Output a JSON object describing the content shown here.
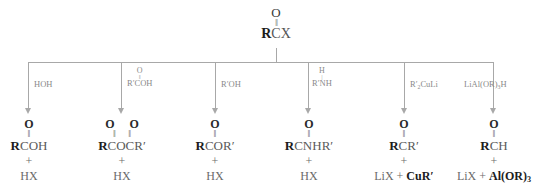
{
  "diagram": {
    "type": "reaction-scheme",
    "line_color": "#a8a8a8",
    "text_color": "#3a3a3a",
    "emphasis_color": "#1c1c1c",
    "background": "#ffffff"
  },
  "starting_material": {
    "carbonyl_oxygen": "O",
    "double_bond": "‖",
    "formula_bold": "R",
    "formula_rest": "CX",
    "name": "acyl-halide"
  },
  "branches": [
    {
      "id": "hydrolysis",
      "reagent": {
        "main": "HOH",
        "top": "",
        "bond": ""
      },
      "product": {
        "oxygens": "O",
        "bonds": "‖",
        "formula_bold": "R",
        "formula_rest": "COH",
        "plus": "+",
        "byproduct_plain": "HX",
        "byproduct_bold": ""
      }
    },
    {
      "id": "anhydride-formation",
      "reagent": {
        "main": "R′COH",
        "top": "O",
        "bond": "‖"
      },
      "product": {
        "oxygens": "O  O",
        "bonds": "‖  ‖",
        "formula_bold": "R",
        "formula_rest": "COCR′",
        "plus": "+",
        "byproduct_plain": "HX",
        "byproduct_bold": ""
      }
    },
    {
      "id": "esterification",
      "reagent": {
        "main": "R′OH",
        "top": "",
        "bond": ""
      },
      "product": {
        "oxygens": "O",
        "bonds": "‖",
        "formula_bold": "R",
        "formula_rest": "COR′",
        "plus": "+",
        "byproduct_plain": "HX",
        "byproduct_bold": ""
      }
    },
    {
      "id": "amide-formation",
      "reagent": {
        "main": "R′NH",
        "top": "H",
        "bond": "|"
      },
      "product": {
        "oxygens": "O",
        "bonds": "‖",
        "formula_bold": "R",
        "formula_rest": "CNHR′",
        "plus": "+",
        "byproduct_plain": "HX",
        "byproduct_bold": ""
      }
    },
    {
      "id": "ketone-formation",
      "reagent": {
        "main": "R′₂CuLi",
        "top": "",
        "bond": ""
      },
      "product": {
        "oxygens": "O",
        "bonds": "‖",
        "formula_bold": "R",
        "formula_rest": "CR′",
        "plus": "+",
        "byproduct_plain": "LiX  +  ",
        "byproduct_bold": "CuR′"
      }
    },
    {
      "id": "aldehyde-formation",
      "reagent": {
        "main": "LiAl(OR)₃H",
        "top": "",
        "bond": ""
      },
      "product": {
        "oxygens": "O",
        "bonds": "‖",
        "formula_bold": "R",
        "formula_rest": "CH",
        "plus": "+",
        "byproduct_plain": "LiX  +  ",
        "byproduct_bold": "Al(OR)₃"
      }
    }
  ]
}
